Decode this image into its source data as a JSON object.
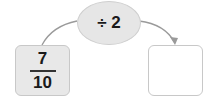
{
  "operation": {
    "label": "÷ 2"
  },
  "input": {
    "numerator": "7",
    "denominator": "10"
  },
  "output": {
    "value": ""
  },
  "colors": {
    "oval_fill": "#e6e6e6",
    "input_fill": "#e8e8e8",
    "output_fill": "#ffffff",
    "arrow": "#999999"
  }
}
